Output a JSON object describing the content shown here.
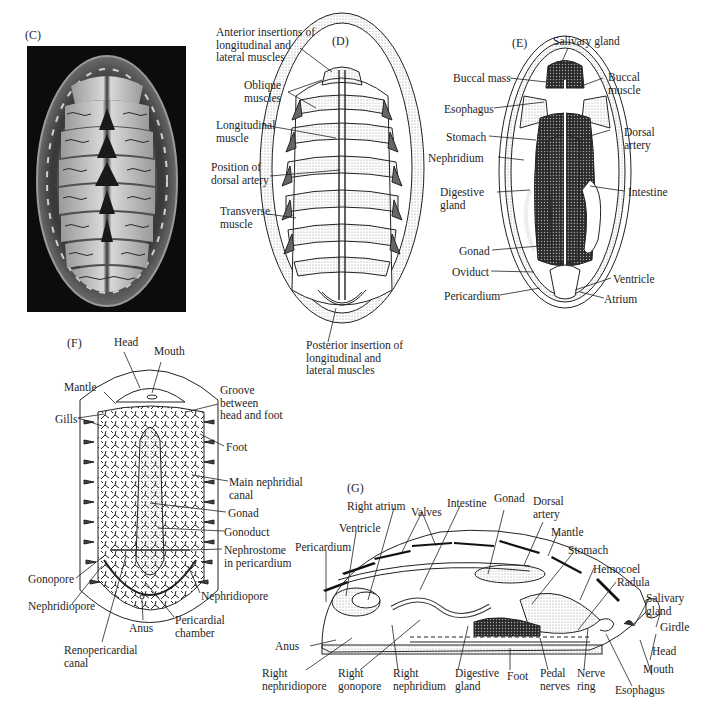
{
  "panels": {
    "C": {
      "letter": "(C)",
      "description": "photograph of chiton dorsal view"
    },
    "D": {
      "letter": "(D)",
      "labels": {
        "anterior_insertions": "Anterior insertions of\nlongitudinal and\nlateral muscles",
        "oblique": "Oblique\nmuscles",
        "longitudinal": "Longitudinal\nmuscle",
        "dorsal_artery": "Position of\ndorsal artery",
        "transverse": "Transverse\nmuscle",
        "posterior_insertion": "Posterior insertion of\nlongitudinal and\nlateral muscles"
      }
    },
    "E": {
      "letter": "(E)",
      "labels": {
        "salivary_gland": "Salivary gland",
        "buccal_mass": "Buccal mass",
        "buccal_muscle": "Buccal\nmuscle",
        "esophagus": "Esophagus",
        "stomach": "Stomach",
        "dorsal_artery": "Dorsal\nartery",
        "nephridium": "Nephridium",
        "digestive_gland": "Digestive\ngland",
        "intestine": "Intestine",
        "gonad": "Gonad",
        "oviduct": "Oviduct",
        "ventricle": "Ventricle",
        "pericardium": "Pericardium",
        "atrium": "Atrium"
      }
    },
    "F": {
      "letter": "(F)",
      "labels": {
        "head": "Head",
        "mouth": "Mouth",
        "mantle": "Mantle",
        "groove": "Groove\nbetween\nhead and foot",
        "gills": "Gills",
        "foot": "Foot",
        "main_nephridial_canal": "Main nephridial\ncanal",
        "gonad": "Gonad",
        "gonoduct": "Gonoduct",
        "nephrostome": "Nephrostome\nin pericardium",
        "gonopore": "Gonopore",
        "nephridiopore_left": "Nephridiopore",
        "nephridiopore_right": "Nephridiopore",
        "anus": "Anus",
        "pericardial_chamber": "Pericardial\nchamber",
        "renopericardial_canal": "Renopericardial\ncanal"
      }
    },
    "G": {
      "letter": "(G)",
      "labels": {
        "right_atrium": "Right atrium",
        "valves": "Valves",
        "intestine": "Intestine",
        "gonad": "Gonad",
        "dorsal_artery": "Dorsal\nartery",
        "ventricle": "Ventricle",
        "mantle": "Mantle",
        "pericardium": "Pericardium",
        "stomach": "Stomach",
        "hemocoel": "Hemocoel",
        "radula": "Radula",
        "salivary_gland": "Salivary\ngland",
        "girdle": "Girdle",
        "anus": "Anus",
        "head": "Head",
        "mouth": "Mouth",
        "right_nephridiopore": "Right\nnephridiopore",
        "right_gonopore": "Right\ngonopore",
        "right_nephridium": "Right\nnephridium",
        "digestive_gland": "Digestive\ngland",
        "foot": "Foot",
        "pedal_nerves": "Pedal\nnerves",
        "nerve_ring": "Nerve\nring",
        "esophagus": "Esophagus"
      }
    }
  }
}
